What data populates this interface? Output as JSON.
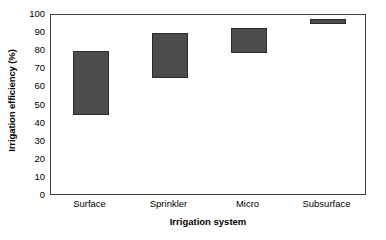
{
  "chart_data": {
    "type": "bar",
    "subtype": "floating-range-bar",
    "title": "",
    "xlabel": "Irrigation system",
    "ylabel": "Irrigation efficiency (%)",
    "categories": [
      "Surface",
      "Sprinkler",
      "Micro",
      "Subsurface"
    ],
    "series": [
      {
        "name": "Irrigation efficiency range",
        "low": [
          45,
          65,
          79,
          95
        ],
        "high": [
          80,
          90,
          93,
          98
        ]
      }
    ],
    "ylim": [
      0,
      100
    ],
    "ytick_interval": 10,
    "yticks": [
      100,
      90,
      80,
      70,
      60,
      50,
      40,
      30,
      20,
      10,
      0
    ],
    "ytick_labels": [
      "100",
      "90",
      "80",
      "70",
      "60",
      "50",
      "40",
      "30",
      "20",
      "10",
      "0"
    ],
    "grid": false,
    "legend": "none",
    "bar_fill_color": "#4c4c4c",
    "bar_border_color": "#2b2b2b",
    "axis_color": "#3f3f3f",
    "background_color": "#ffffff"
  }
}
